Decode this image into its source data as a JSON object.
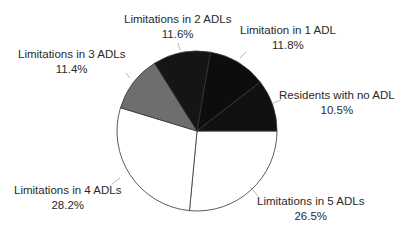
{
  "chart_data": {
    "type": "pie",
    "title": "",
    "start_angle_deg": 0,
    "direction": "clockwise",
    "slices": [
      {
        "label": "Limitations in 5 ADLs",
        "value": 26.5,
        "display": "26.5%",
        "color": "#ffffff"
      },
      {
        "label": "Limitations in 4 ADLs",
        "value": 28.2,
        "display": "28.2%",
        "color": "#ffffff"
      },
      {
        "label": "Limitations in 3 ADLs",
        "value": 11.4,
        "display": "11.4%",
        "color": "#6e6e6e"
      },
      {
        "label": "Limitations in 2 ADLs",
        "value": 11.6,
        "display": "11.6%",
        "color": "#151515"
      },
      {
        "label": "Limitation in 1 ADL",
        "value": 11.8,
        "display": "11.8%",
        "color": "#0d0d0d"
      },
      {
        "label": "Residents with no ADL",
        "value": 10.5,
        "display": "10.5%",
        "color": "#111111"
      }
    ],
    "legend": "none (direct labels)",
    "unit": "%"
  },
  "labels": [
    {
      "name": "Limitations in 5 ADLs",
      "pct": "26.5%"
    },
    {
      "name": "Limitations in 4 ADLs",
      "pct": "28.2%"
    },
    {
      "name": "Limitations in 3 ADLs",
      "pct": "11.4%"
    },
    {
      "name": "Limitations in 2 ADLs",
      "pct": "11.6%"
    },
    {
      "name": "Limitation in 1 ADL",
      "pct": "11.8%"
    },
    {
      "name": "Residents with no ADL",
      "pct": "10.5%"
    }
  ]
}
